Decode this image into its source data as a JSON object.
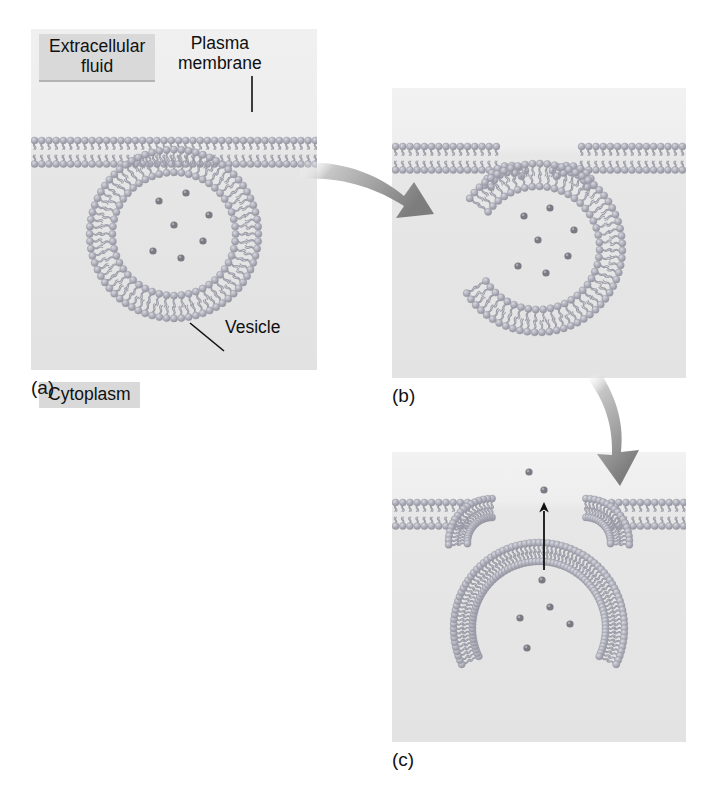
{
  "figure": {
    "background_color": "#ffffff"
  },
  "labels": {
    "extracellular_fluid": "Extracellular\nfluid",
    "extracellular_fluid_line1": "Extracellular",
    "extracellular_fluid_line2": "fluid",
    "plasma_membrane_line1": "Plasma",
    "plasma_membrane_line2": "membrane",
    "cytoplasm": "Cytoplasm",
    "vesicle": "Vesicle"
  },
  "panels": [
    {
      "id": "a",
      "caption": "(a)",
      "description": "Vesicle in cytoplasm approaching plasma membrane",
      "x": 31,
      "y": 29,
      "width": 286,
      "height": 341,
      "membrane_y": 115,
      "vesicle": {
        "center_x": 143,
        "center_y": 205,
        "outer_radius": 88,
        "inner_radius": 58,
        "molecule_count": 7
      },
      "molecules": [
        {
          "x": 128,
          "y": 172
        },
        {
          "x": 155,
          "y": 164
        },
        {
          "x": 178,
          "y": 186
        },
        {
          "x": 143,
          "y": 196
        },
        {
          "x": 122,
          "y": 222
        },
        {
          "x": 150,
          "y": 229
        },
        {
          "x": 172,
          "y": 212
        }
      ]
    },
    {
      "id": "b",
      "caption": "(b)",
      "description": "Vesicle membrane fusing with plasma membrane",
      "x": 392,
      "y": 88,
      "width": 294,
      "height": 290,
      "membrane_y": 62,
      "vesicle": {
        "center_x": 146,
        "center_y": 160,
        "outer_radius": 88,
        "inner_radius": 58,
        "molecule_count": 7
      },
      "molecules": [
        {
          "x": 132,
          "y": 128
        },
        {
          "x": 158,
          "y": 120
        },
        {
          "x": 182,
          "y": 142
        },
        {
          "x": 146,
          "y": 152
        },
        {
          "x": 126,
          "y": 178
        },
        {
          "x": 154,
          "y": 185
        },
        {
          "x": 176,
          "y": 168
        }
      ]
    },
    {
      "id": "c",
      "caption": "(c)",
      "description": "Vesicle opened to extracellular fluid releasing molecules",
      "x": 392,
      "y": 452,
      "width": 294,
      "height": 290,
      "membrane_y": 54,
      "released_molecules": [
        {
          "x": 137,
          "y": 20
        },
        {
          "x": 152,
          "y": 38
        }
      ],
      "inner_molecules": [
        {
          "x": 150,
          "y": 128
        },
        {
          "x": 158,
          "y": 155
        },
        {
          "x": 128,
          "y": 166
        },
        {
          "x": 178,
          "y": 172
        },
        {
          "x": 135,
          "y": 196
        }
      ],
      "release_arrow": {
        "from_y": 118,
        "to_y": 50,
        "x": 152,
        "color": "#111111"
      }
    }
  ],
  "flow_arrows": [
    {
      "id": "arrow-a-to-b",
      "from_panel": "a",
      "to_panel": "b",
      "direction": "right-down",
      "color": "#8e8e8e"
    },
    {
      "id": "arrow-b-to-c",
      "from_panel": "b",
      "to_panel": "c",
      "direction": "down",
      "color": "#8e8e8e"
    }
  ],
  "colors": {
    "panel_background_top": "#eeeeee",
    "panel_background_bottom": "#e4e4e4",
    "lipid_head": "#a8a8b4",
    "lipid_head_highlight": "#cfcfd8",
    "lipid_tail": "#9a9aa6",
    "molecule": "#6e6e78",
    "label_box": "#d9d9d9",
    "text": "#101010",
    "flow_arrow": "#8e8e8e",
    "release_arrow": "#111111"
  }
}
